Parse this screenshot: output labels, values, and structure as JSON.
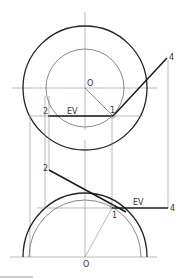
{
  "figure": {
    "top_view": {
      "center_label": "O",
      "point_1_label": "1",
      "point_2_label": "2",
      "point_4_label": "4",
      "true_length_label": "EV"
    },
    "front_view": {
      "center_label": "O",
      "point_1_label": "1",
      "point_2_label": "2",
      "point_4_label": "4",
      "true_length_label": "EV"
    }
  }
}
